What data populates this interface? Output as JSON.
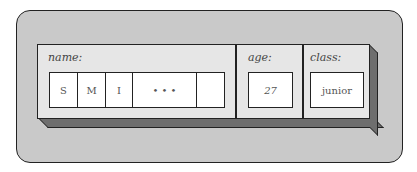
{
  "record": {
    "fields": [
      {
        "label": "name:",
        "cells": [
          "S",
          "M",
          "I",
          "• • •",
          ""
        ]
      },
      {
        "label": "age:",
        "value": "27"
      },
      {
        "label": "class:",
        "value": "junior"
      }
    ]
  },
  "colors": {
    "background_panel": "#c9c9c9",
    "slab_face": "#e6e6e6",
    "slab_shadow": "#6e6e6e",
    "outline": "#222222",
    "cell_fill": "#ffffff"
  }
}
